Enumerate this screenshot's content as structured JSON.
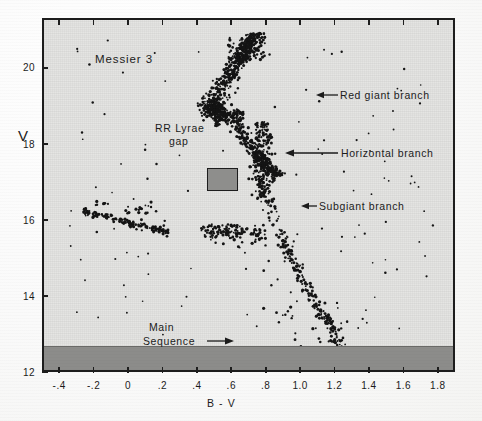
{
  "figure": {
    "object_name": "Messier 3",
    "annotations": {
      "rr_lyrae_gap_line1": "RR Lyrae",
      "rr_lyrae_gap_line2": "gap",
      "red_giant_branch": "Red giant branch",
      "horizontal_branch": "Horizontal branch",
      "subgiant_branch": "Subgiant branch",
      "main_sequence_line1": "Main",
      "main_sequence_line2": "Sequence"
    },
    "colors": {
      "plot_background": "#e3e3e1",
      "obscured_band": "#8c8c8a",
      "frame": "#1d1d1d",
      "star_point": "#141414",
      "rr_gap_fill": "#8e8e8c"
    }
  },
  "chart_data": {
    "type": "scatter",
    "title": "Messier 3",
    "xlabel": "B - V",
    "ylabel": "V",
    "xlim": [
      -0.5,
      1.9
    ],
    "ylim": [
      21.3,
      12.0
    ],
    "y_inverted": true,
    "grid": false,
    "legend": "none",
    "xticks": [
      -0.4,
      -0.2,
      0.0,
      0.2,
      0.4,
      0.6,
      0.8,
      1.0,
      1.2,
      1.4,
      1.6,
      1.8
    ],
    "xticklabels": [
      "-.4",
      "-.2",
      "0",
      ".2",
      ".4",
      ".6",
      ".8",
      "1.0",
      "1.2",
      "1.4",
      "1.6",
      "1.8"
    ],
    "yticks": [
      12,
      14,
      16,
      18,
      20
    ],
    "yticklabels": [
      "12",
      "14",
      "16",
      "18",
      "20"
    ],
    "annotations": [
      {
        "text": "Messier 3",
        "x": 0.05,
        "y": 13.0,
        "kind": "title-text"
      },
      {
        "text": "RR Lyrae",
        "x": 0.28,
        "y": 14.9,
        "kind": "label"
      },
      {
        "text": "gap",
        "x": 0.33,
        "y": 15.2,
        "kind": "label"
      },
      {
        "text": "Red giant branch",
        "x": 1.12,
        "y": 13.7,
        "kind": "arrow-label",
        "arrow_to_x": 1.02,
        "arrow_to_y": 13.7
      },
      {
        "text": "Horizontal branch",
        "x": 1.12,
        "y": 15.4,
        "kind": "arrow-label",
        "arrow_to_x": 0.8,
        "arrow_to_y": 15.4
      },
      {
        "text": "Subgiant branch",
        "x": 1.0,
        "y": 16.9,
        "kind": "arrow-label",
        "arrow_to_x": 0.9,
        "arrow_to_y": 16.9
      },
      {
        "text": "Main",
        "x": 0.25,
        "y": 20.4,
        "kind": "arrow-label"
      },
      {
        "text": "Sequence",
        "x": 0.25,
        "y": 20.6,
        "kind": "arrow-label",
        "arrow_to_x": 0.56,
        "arrow_to_y": 20.6
      }
    ],
    "regions": [
      {
        "name": "rr-lyrae-gap-box",
        "x0": 0.21,
        "x1": 0.38,
        "y0": 15.35,
        "y1": 15.85,
        "fill": "#8e8e8c"
      },
      {
        "name": "obscured-band",
        "x0": -0.5,
        "x1": 1.9,
        "y0": 20.85,
        "y1": 21.3,
        "fill": "#8c8c8a"
      }
    ],
    "series": [
      {
        "name": "Blue horizontal branch",
        "n_points": 120,
        "description": "Stars at V~15.6-16.2 spanning B-V from -0.25 to 0.20"
      },
      {
        "name": "Red horizontal branch",
        "n_points": 90,
        "description": "Stars at V~15.5-15.9 spanning B-V from 0.42 to 0.78"
      },
      {
        "name": "Red giant branch",
        "n_points": 200,
        "description": "Rising sequence from (0.75, 17.5) up to (1.25, 12.6)"
      },
      {
        "name": "Subgiant branch",
        "n_points": 260,
        "description": "Stars from (0.62, 18.9) spreading to (0.85, 17.0)"
      },
      {
        "name": "Main sequence turnoff",
        "n_points": 230,
        "description": "Clump near (0.50, 19.0) extending to (0.62, 18.7)"
      },
      {
        "name": "Main sequence",
        "n_points": 330,
        "description": "Descending band from (0.48, 19.3) to (0.72, 20.9)"
      },
      {
        "name": "Field / scattered stars",
        "n_points": 110,
        "description": "Sparse points distributed across the diagram"
      }
    ]
  },
  "axes": {
    "y_label": "V",
    "x_label": "B - V"
  }
}
